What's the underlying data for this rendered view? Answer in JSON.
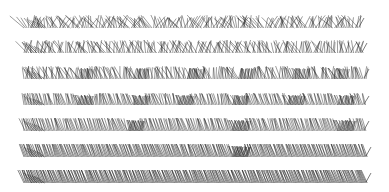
{
  "canvas": {
    "width": 389,
    "height": 192,
    "background": "#ffffff",
    "stroke_color": "#222222"
  },
  "bands": [
    {
      "id": "band-1",
      "top": 15,
      "bottom": 28,
      "x_start": 24,
      "x_end": 361,
      "spacing": 1.6,
      "jitter": 0.9,
      "tilt": 0.2,
      "dark_nodes": [],
      "taper": 0.0
    },
    {
      "id": "band-2",
      "top": 40,
      "bottom": 53,
      "x_start": 24,
      "x_end": 364,
      "spacing": 1.6,
      "jitter": 0.7,
      "tilt": 0.25,
      "dark_nodes": [],
      "taper": 0.0
    },
    {
      "id": "band-3",
      "top": 66,
      "bottom": 79,
      "x_start": 24,
      "x_end": 366,
      "spacing": 1.5,
      "jitter": 0.45,
      "tilt": 0.3,
      "dark_nodes": [
        85,
        140,
        195,
        245,
        300,
        340
      ],
      "taper": 0.0
    },
    {
      "id": "band-4",
      "top": 93,
      "bottom": 105,
      "x_start": 24,
      "x_end": 366,
      "spacing": 1.4,
      "jitter": 0.25,
      "tilt": 0.35,
      "dark_nodes": [
        85,
        140,
        185,
        240,
        295,
        345
      ],
      "taper": 0.0
    },
    {
      "id": "band-5",
      "top": 118,
      "bottom": 131,
      "x_start": 24,
      "x_end": 366,
      "spacing": 1.3,
      "jitter": 0.15,
      "tilt": 0.4,
      "dark_nodes": [
        135,
        240,
        345
      ],
      "taper": 0.0
    },
    {
      "id": "band-6",
      "top": 144,
      "bottom": 157,
      "x_start": 24,
      "x_end": 368,
      "spacing": 1.2,
      "jitter": 0.05,
      "tilt": 0.45,
      "dark_nodes": [
        240
      ],
      "taper": 0.3
    },
    {
      "id": "band-7",
      "top": 170,
      "bottom": 183,
      "x_start": 24,
      "x_end": 368,
      "spacing": 1.1,
      "jitter": 0.0,
      "tilt": 0.5,
      "dark_nodes": [],
      "taper": 0.4
    }
  ]
}
